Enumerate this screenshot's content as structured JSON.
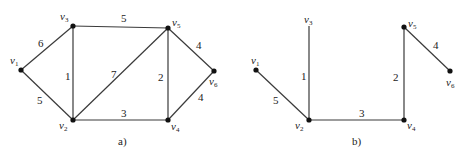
{
  "diagrams": [
    {
      "id": "a",
      "caption": "a)",
      "nodes": [
        {
          "id": "v1",
          "label": "v",
          "sub": "1",
          "x": 21,
          "y": 70,
          "lx": 10,
          "ly": 64,
          "dot": true
        },
        {
          "id": "v3",
          "label": "v",
          "sub": "3",
          "x": 73,
          "y": 26,
          "lx": 60,
          "ly": 20,
          "dot": true
        },
        {
          "id": "v5",
          "label": "v",
          "sub": "5",
          "x": 168,
          "y": 28,
          "lx": 172,
          "ly": 26,
          "dot": true
        },
        {
          "id": "v6",
          "label": "v",
          "sub": "6",
          "x": 214,
          "y": 71,
          "lx": 209,
          "ly": 85,
          "dot": true
        },
        {
          "id": "v2",
          "label": "v",
          "sub": "2",
          "x": 73,
          "y": 120,
          "lx": 59,
          "ly": 129,
          "dot": true
        },
        {
          "id": "v4",
          "label": "v",
          "sub": "4",
          "x": 168,
          "y": 120,
          "lx": 171,
          "ly": 130,
          "dot": true
        }
      ],
      "edges": [
        {
          "from": "v1",
          "to": "v3",
          "weight": "6",
          "wx": 38,
          "wy": 47
        },
        {
          "from": "v1",
          "to": "v2",
          "weight": "5",
          "wx": 37,
          "wy": 104
        },
        {
          "from": "v3",
          "to": "v5",
          "weight": "5",
          "wx": 121,
          "wy": 22
        },
        {
          "from": "v3",
          "to": "v2",
          "weight": "1",
          "wx": 65,
          "wy": 80
        },
        {
          "from": "v2",
          "to": "v5",
          "weight": "7",
          "wx": 111,
          "wy": 78
        },
        {
          "from": "v5",
          "to": "v4",
          "weight": "2",
          "wx": 158,
          "wy": 81
        },
        {
          "from": "v5",
          "to": "v6",
          "weight": "4",
          "wx": 196,
          "wy": 49
        },
        {
          "from": "v4",
          "to": "v6",
          "weight": "4",
          "wx": 198,
          "wy": 101
        },
        {
          "from": "v2",
          "to": "v4",
          "weight": "3",
          "wx": 121,
          "wy": 117
        }
      ],
      "caption_pos": {
        "x": 118,
        "y": 145
      }
    },
    {
      "id": "b",
      "caption": "b)",
      "nodes": [
        {
          "id": "v1",
          "label": "v",
          "sub": "1",
          "x": 256,
          "y": 70,
          "lx": 251,
          "ly": 64,
          "dot": true
        },
        {
          "id": "v3",
          "label": "v",
          "sub": "3",
          "x": 309,
          "y": 26,
          "lx": 304,
          "ly": 23,
          "dot": false
        },
        {
          "id": "v5",
          "label": "v",
          "sub": "5",
          "x": 404,
          "y": 27,
          "lx": 408,
          "ly": 27,
          "dot": true
        },
        {
          "id": "v6",
          "label": "v",
          "sub": "6",
          "x": 450,
          "y": 71,
          "lx": 446,
          "ly": 86,
          "dot": true
        },
        {
          "id": "v2",
          "label": "v",
          "sub": "2",
          "x": 309,
          "y": 120,
          "lx": 295,
          "ly": 129,
          "dot": true
        },
        {
          "id": "v4",
          "label": "v",
          "sub": "4",
          "x": 404,
          "y": 120,
          "lx": 407,
          "ly": 129,
          "dot": true
        }
      ],
      "edges": [
        {
          "from": "v1",
          "to": "v2",
          "weight": "5",
          "wx": 273,
          "wy": 104
        },
        {
          "from": "v3",
          "to": "v2",
          "weight": "1",
          "wx": 301,
          "wy": 80
        },
        {
          "from": "v2",
          "to": "v4",
          "weight": "3",
          "wx": 359,
          "wy": 117
        },
        {
          "from": "v5",
          "to": "v4",
          "weight": "2",
          "wx": 393,
          "wy": 81
        },
        {
          "from": "v5",
          "to": "v6",
          "weight": "4",
          "wx": 433,
          "wy": 49
        }
      ],
      "caption_pos": {
        "x": 352,
        "y": 145
      }
    }
  ]
}
